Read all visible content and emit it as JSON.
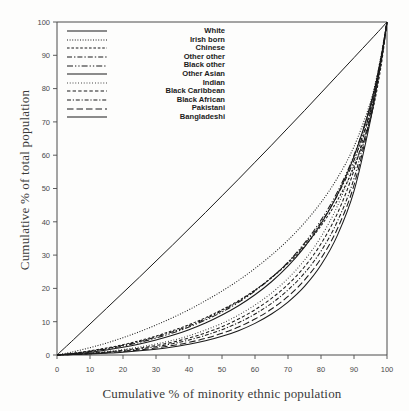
{
  "chart_data": {
    "type": "line",
    "title": "",
    "xlabel": "Cumulative % of minority ethnic population",
    "ylabel": "Cumulative % of total population",
    "xlim": [
      0,
      100
    ],
    "ylim": [
      0,
      100
    ],
    "xticks": [
      "0",
      "10",
      "20",
      "30",
      "40",
      "50",
      "60",
      "70",
      "80",
      "90",
      "100"
    ],
    "yticks": [
      "0",
      "10",
      "20",
      "30",
      "40",
      "50",
      "60",
      "70",
      "80",
      "90",
      "100"
    ],
    "grid": false,
    "legend_position": "top-left",
    "x": [
      0,
      5,
      10,
      15,
      20,
      25,
      30,
      35,
      40,
      45,
      50,
      55,
      60,
      65,
      70,
      75,
      80,
      85,
      90,
      95,
      98,
      100
    ],
    "series": [
      {
        "name": "White",
        "dash": "solid",
        "values": [
          0,
          4.6,
          9.3,
          14.0,
          18.7,
          23.4,
          28.2,
          33.0,
          37.9,
          42.8,
          47.8,
          52.8,
          57.9,
          63.0,
          68.2,
          73.4,
          78.7,
          84.0,
          89.3,
          94.6,
          97.8,
          100
        ]
      },
      {
        "name": "Irish born",
        "dash": "fine-dotted",
        "values": [
          0,
          1.0,
          2.2,
          3.6,
          5.2,
          7.0,
          9.0,
          11.2,
          13.6,
          16.3,
          19.2,
          22.4,
          26.0,
          30.0,
          34.5,
          39.7,
          45.8,
          53.2,
          62.6,
          76.0,
          88.5,
          100
        ]
      },
      {
        "name": "Chinese",
        "dash": "short-dash",
        "values": [
          0,
          0.55,
          1.25,
          2.1,
          3.1,
          4.3,
          5.7,
          7.3,
          9.1,
          11.2,
          13.6,
          16.3,
          19.5,
          23.2,
          27.5,
          32.6,
          38.8,
          46.5,
          56.5,
          71.0,
          85.5,
          100
        ]
      },
      {
        "name": "Other other",
        "dash": "dash-dot",
        "values": [
          0,
          0.5,
          1.15,
          1.95,
          2.9,
          4.05,
          5.4,
          6.95,
          8.75,
          10.85,
          13.3,
          16.1,
          19.4,
          23.3,
          27.8,
          33.2,
          39.8,
          48.0,
          58.5,
          73.2,
          86.8,
          100
        ]
      },
      {
        "name": "Black other",
        "dash": "dash-dot-dot",
        "values": [
          0,
          0.45,
          1.05,
          1.8,
          2.7,
          3.8,
          5.1,
          6.6,
          8.4,
          10.5,
          12.9,
          15.8,
          19.2,
          23.2,
          27.9,
          33.6,
          40.5,
          49.0,
          60.0,
          74.8,
          87.8,
          100
        ]
      },
      {
        "name": "Other Asian",
        "dash": "solid",
        "values": [
          0,
          0.35,
          0.85,
          1.5,
          2.3,
          3.3,
          4.5,
          5.9,
          7.6,
          9.6,
          12.0,
          14.8,
          18.1,
          22.0,
          26.7,
          32.4,
          39.4,
          48.2,
          59.6,
          75.0,
          88.0,
          100
        ]
      },
      {
        "name": "Indian",
        "dash": "dotted",
        "values": [
          0,
          0.25,
          0.6,
          1.05,
          1.65,
          2.4,
          3.3,
          4.4,
          5.8,
          7.5,
          9.5,
          12.0,
          15.0,
          18.6,
          23.0,
          28.5,
          35.5,
          44.8,
          57.5,
          75.2,
          89.0,
          100
        ]
      },
      {
        "name": "Black Caribbean",
        "dash": "dashed",
        "values": [
          0,
          0.2,
          0.5,
          0.9,
          1.4,
          2.05,
          2.85,
          3.85,
          5.1,
          6.65,
          8.5,
          10.8,
          13.6,
          17.0,
          21.2,
          26.5,
          33.4,
          42.6,
          55.5,
          74.0,
          88.5,
          100
        ]
      },
      {
        "name": "Black African",
        "dash": "dash-dot-short",
        "values": [
          0,
          0.18,
          0.45,
          0.8,
          1.25,
          1.8,
          2.5,
          3.4,
          4.5,
          5.9,
          7.6,
          9.7,
          12.3,
          15.5,
          19.5,
          24.6,
          31.2,
          40.2,
          53.0,
          72.5,
          87.8,
          100
        ]
      },
      {
        "name": "Pakistani",
        "dash": "long-dash",
        "values": [
          0,
          0.15,
          0.38,
          0.68,
          1.05,
          1.52,
          2.1,
          2.85,
          3.8,
          5.0,
          6.5,
          8.4,
          10.8,
          13.8,
          17.6,
          22.5,
          29.0,
          38.0,
          51.0,
          71.5,
          87.5,
          100
        ]
      },
      {
        "name": "Bangladeshi",
        "dash": "solid",
        "values": [
          0,
          0.12,
          0.3,
          0.55,
          0.85,
          1.25,
          1.75,
          2.4,
          3.2,
          4.25,
          5.6,
          7.3,
          9.5,
          12.3,
          15.9,
          20.6,
          27.0,
          36.0,
          49.2,
          70.5,
          87.0,
          100
        ]
      }
    ]
  },
  "axes": {
    "x_title": "Cumulative % of minority ethnic population",
    "y_title": "Cumulative % of total population"
  },
  "legend": {
    "items": [
      {
        "label": "White"
      },
      {
        "label": "Irish born"
      },
      {
        "label": "Chinese"
      },
      {
        "label": "Other other"
      },
      {
        "label": "Black other"
      },
      {
        "label": "Other Asian"
      },
      {
        "label": "Indian"
      },
      {
        "label": "Black Caribbean"
      },
      {
        "label": "Black African"
      },
      {
        "label": "Pakistani"
      },
      {
        "label": "Bangladeshi"
      }
    ]
  },
  "colors": {
    "ink": "#1a1a1a",
    "axis": "#4a4a4a",
    "background": "#fdfdfc"
  }
}
